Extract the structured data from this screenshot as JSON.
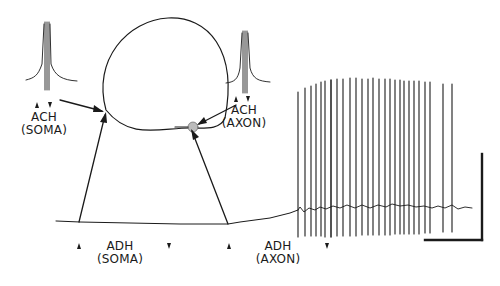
{
  "labels": {
    "ach_soma": {
      "line1": "ACH",
      "line2": "(SOMA)"
    },
    "ach_axon": {
      "line1": "ACH",
      "line2": "(AXON)"
    },
    "adh_soma": {
      "line1": "ADH",
      "line2": "(SOMA)"
    },
    "adh_axon": {
      "line1": "ADH",
      "line2": "(AXON)"
    }
  },
  "colors": {
    "ink": "#1a1a1a",
    "background": "#ffffff"
  },
  "figure": {
    "spike_train": {
      "spike_count": 27,
      "start_x_px": 298,
      "end_x_px": 453
    },
    "scale_bar": {
      "vertical": true,
      "horizontal": true,
      "units_shown": false
    }
  }
}
